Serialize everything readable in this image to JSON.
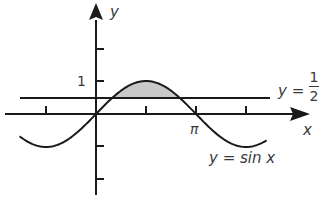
{
  "chart_data": {
    "type": "line",
    "title": "",
    "xlabel": "x",
    "ylabel": "y",
    "x_ticks": [
      {
        "value": -1.5708,
        "label": ""
      },
      {
        "value": 1.5708,
        "label": ""
      },
      {
        "value": 3.14159,
        "label": "π"
      },
      {
        "value": 4.7124,
        "label": ""
      }
    ],
    "y_ticks": [
      {
        "value": 1,
        "label": "1"
      },
      {
        "value": 2,
        "label": ""
      },
      {
        "value": -1,
        "label": ""
      },
      {
        "value": -2,
        "label": ""
      }
    ],
    "xlim": [
      -2.8,
      6.6
    ],
    "ylim": [
      -3.5,
      3.3
    ],
    "grid": false,
    "series": [
      {
        "name": "y = sin x",
        "function": "sin(x)",
        "x_range": [
          -2.4,
          5.36
        ]
      },
      {
        "name": "y = 1/2",
        "function": "0.5",
        "x_range": [
          -2.4,
          5.4
        ]
      }
    ],
    "shaded_region": {
      "between": [
        "y = sin x",
        "y = 1/2"
      ],
      "x_range": [
        0.5236,
        2.618
      ],
      "color": "#c8c8c8"
    },
    "annotations": [
      {
        "text": "y = sin x",
        "near": "trough right of π"
      },
      {
        "text": "y = 1/2",
        "near": "right end of horizontal line"
      }
    ]
  },
  "labels": {
    "y_axis": "y",
    "x_axis": "x",
    "tick_one": "1",
    "tick_pi": "π",
    "sine_label": "y = sin x",
    "half_label_lhs": "y =",
    "half_num": "1",
    "half_den": "2"
  },
  "colors": {
    "ink": "#1a1a1a",
    "shade": "#c8c8c8",
    "text": "#3a3a3a"
  }
}
